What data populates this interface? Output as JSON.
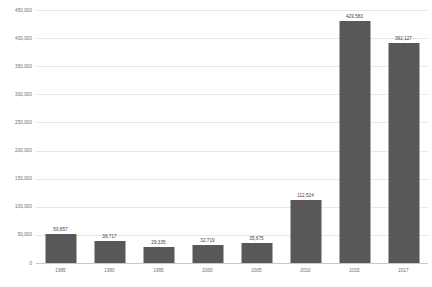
{
  "chart_data": {
    "type": "bar",
    "title": "",
    "subtitle": "",
    "xlabel": "",
    "ylabel": "",
    "categories": [
      "1985",
      "1990",
      "1995",
      "2000",
      "2005",
      "2010",
      "2015",
      "2017"
    ],
    "values": [
      50857,
      38717,
      29335,
      32719,
      35675,
      112524,
      429583,
      392127
    ],
    "value_labels": [
      "50,857",
      "38,717",
      "29,335",
      "32,719",
      "35,675",
      "112,524",
      "429,583",
      "392,127"
    ],
    "ylim": [
      0,
      450000
    ],
    "ytick_values": [
      0,
      50000,
      100000,
      150000,
      200000,
      250000,
      300000,
      350000,
      400000,
      450000
    ],
    "ytick_labels": [
      "0",
      "50,000",
      "100,000",
      "150,000",
      "200,000",
      "250,000",
      "300,000",
      "350,000",
      "400,000",
      "450,000"
    ],
    "grid": true,
    "grid_axis": "y",
    "legend": false,
    "legend_position": "none",
    "bar_color": "#585858",
    "grid_color": "#e8e8e8",
    "axis_color": "#c9c9c9",
    "tick_label_color": "#6d6d6d",
    "value_label_color": "#3d3d3d",
    "background_color": "#ffffff",
    "annotations": []
  }
}
